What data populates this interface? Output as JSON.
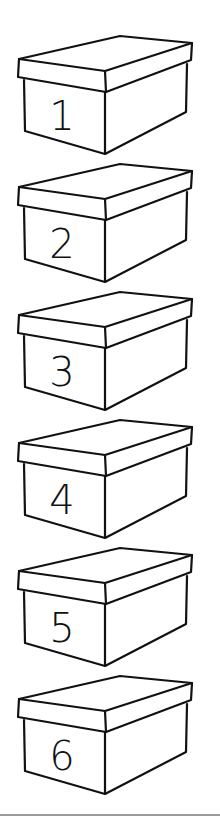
{
  "worksheet": {
    "boxes": [
      {
        "label": "1",
        "top": 34
      },
      {
        "label": "2",
        "top": 162
      },
      {
        "label": "3",
        "top": 290
      },
      {
        "label": "4",
        "top": 418
      },
      {
        "label": "5",
        "top": 546
      },
      {
        "label": "6",
        "top": 674
      }
    ]
  }
}
